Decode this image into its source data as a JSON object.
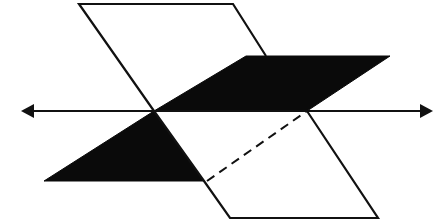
{
  "diagram": {
    "colors": {
      "stroke": "#111111",
      "fill_dark": "#0a0a0a",
      "background": "#ffffff"
    },
    "elements": {
      "vertical_plane": "vertical-plane",
      "horizontal_plane": "horizontal-plane",
      "intersection_line": "intersection-line",
      "hidden_edge": "dashed-hidden-edge"
    }
  }
}
